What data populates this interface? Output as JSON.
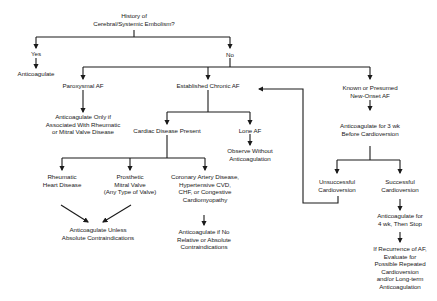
{
  "diagram": {
    "type": "flowchart",
    "topic": "Anticoagulation decision algorithm for atrial fibrillation",
    "nodes": {
      "root": {
        "lines": [
          "History of",
          "Cerebral/Systemic Embolism?"
        ]
      },
      "yes": {
        "lines": [
          "Yes"
        ]
      },
      "yes_anticoagulate": {
        "lines": [
          "Anticoagulate"
        ]
      },
      "no": {
        "lines": [
          "No"
        ]
      },
      "paroxysmal_af": {
        "lines": [
          "Paroxysmal AF"
        ]
      },
      "paroxysmal_action": {
        "lines": [
          "Anticoagulate Only if",
          "Associated With Rheumatic",
          "or Mitral Valve Disease"
        ]
      },
      "established_chronic_af": {
        "lines": [
          "Established Chronic AF"
        ]
      },
      "cardiac_disease_present": {
        "lines": [
          "Cardiac Disease Present"
        ]
      },
      "lone_af": {
        "lines": [
          "Lone AF"
        ]
      },
      "lone_af_action": {
        "lines": [
          "Observe Without",
          "Anticoagulation"
        ]
      },
      "rheumatic": {
        "lines": [
          "Rheumatic",
          "Heart Disease"
        ]
      },
      "prosthetic": {
        "lines": [
          "Prosthetic",
          "Mitral Valve",
          "(Any Type of Valve)"
        ]
      },
      "cad": {
        "lines": [
          "Coronary Artery Disease,",
          "Hypertensive CVD,",
          "CHF, or Congestive",
          "Cardiomyopathy"
        ]
      },
      "valve_action": {
        "lines": [
          "Anticoagulate Unless",
          "Absolute Contraindications"
        ]
      },
      "cad_action": {
        "lines": [
          "Anticoagulate if No",
          "Relative or Absolute",
          "Contraindications"
        ]
      },
      "new_onset_af": {
        "lines": [
          "Known or Presumed",
          "New-Onset AF"
        ]
      },
      "new_onset_action": {
        "lines": [
          "Anticoagulate for 3 wk",
          "Before Cardioversion"
        ]
      },
      "unsuccessful": {
        "lines": [
          "Unsuccessful",
          "Cardioversion"
        ]
      },
      "successful": {
        "lines": [
          "Successful",
          "Cardioversion"
        ]
      },
      "successful_action": {
        "lines": [
          "Anticoagulate for",
          "4 wk, Then Stop"
        ]
      },
      "recurrence_action": {
        "lines": [
          "If Recurrence of AF,",
          "Evaluate for",
          "Possible Repeated",
          "Cardioversion",
          "and/or Long-term",
          "Anticoagulation"
        ]
      }
    },
    "edges": [
      {
        "from": "root",
        "to": "yes"
      },
      {
        "from": "yes",
        "to": "yes_anticoagulate"
      },
      {
        "from": "root",
        "to": "no"
      },
      {
        "from": "no",
        "to": "paroxysmal_af"
      },
      {
        "from": "no",
        "to": "established_chronic_af"
      },
      {
        "from": "no",
        "to": "new_onset_af"
      },
      {
        "from": "paroxysmal_af",
        "to": "paroxysmal_action"
      },
      {
        "from": "established_chronic_af",
        "to": "cardiac_disease_present"
      },
      {
        "from": "established_chronic_af",
        "to": "lone_af"
      },
      {
        "from": "lone_af",
        "to": "lone_af_action"
      },
      {
        "from": "cardiac_disease_present",
        "to": "rheumatic"
      },
      {
        "from": "cardiac_disease_present",
        "to": "prosthetic"
      },
      {
        "from": "cardiac_disease_present",
        "to": "cad"
      },
      {
        "from": "rheumatic",
        "to": "valve_action"
      },
      {
        "from": "prosthetic",
        "to": "valve_action"
      },
      {
        "from": "cad",
        "to": "cad_action"
      },
      {
        "from": "new_onset_af",
        "to": "new_onset_action"
      },
      {
        "from": "new_onset_action",
        "to": "unsuccessful"
      },
      {
        "from": "new_onset_action",
        "to": "successful"
      },
      {
        "from": "unsuccessful",
        "to": "established_chronic_af"
      },
      {
        "from": "successful",
        "to": "successful_action"
      },
      {
        "from": "successful_action",
        "to": "recurrence_action"
      }
    ],
    "colors": {
      "line": "#1a1a1a",
      "text": "#1a1a1a",
      "background": "#ffffff"
    }
  }
}
